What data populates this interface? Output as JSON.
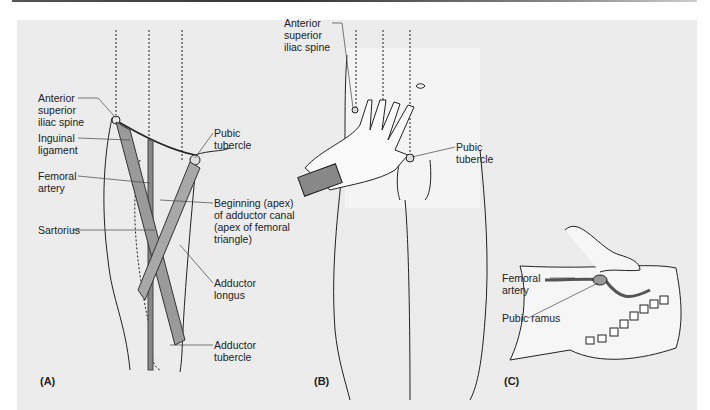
{
  "figure": {
    "panels": [
      {
        "id": "A",
        "label": "(A)",
        "annotations": [
          "Anterior\nsuperior\niliac spine",
          "Inguinal\nligament",
          "Femoral\nartery",
          "Sartorius",
          "Pubic\ntubercle",
          "Beginning (apex)\nof adductor canal\n(apex of femoral\ntriangle)",
          "Adductor\nlongus",
          "Adductor\ntubercle"
        ]
      },
      {
        "id": "B",
        "label": "(B)",
        "annotations": [
          "Anterior\nsuperior\niliac spine",
          "Pubic\ntubercle"
        ]
      },
      {
        "id": "C",
        "label": "(C)",
        "annotations": [
          "Femoral\nartery",
          "Pubic ramus"
        ]
      }
    ]
  }
}
